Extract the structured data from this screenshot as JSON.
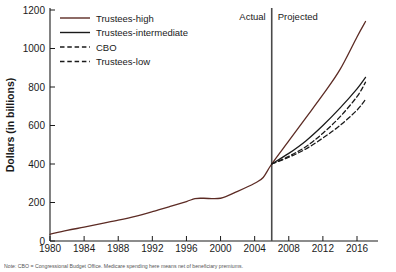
{
  "chart_data": {
    "type": "line",
    "title": "",
    "xlabel": "",
    "ylabel": "Dollars (in billions)",
    "xlim": [
      1980,
      2017
    ],
    "ylim": [
      0,
      1200
    ],
    "xticks": [
      1980,
      1984,
      1988,
      1992,
      1996,
      2000,
      2004,
      2008,
      2012,
      2016
    ],
    "yticks": [
      0,
      200,
      400,
      600,
      800,
      1000,
      1200
    ],
    "grid": false,
    "legend_position": "top-left",
    "annotations": [
      {
        "name": "actual-label",
        "text": "Actual",
        "x": 2003.2,
        "y": 1150
      },
      {
        "name": "projected-label",
        "text": "Projected",
        "x": 2007.0,
        "y": 1150
      },
      {
        "name": "divider",
        "text": "",
        "x": 2006,
        "y": 0
      }
    ],
    "divider_year": 2006,
    "series": [
      {
        "name": "Trustees-high",
        "color": "#5c2b24",
        "dash": "none",
        "x": [
          1980,
          1982,
          1984,
          1986,
          1988,
          1990,
          1992,
          1994,
          1996,
          1997,
          1998,
          2000,
          2002,
          2004,
          2005,
          2006,
          2008,
          2010,
          2012,
          2014,
          2016,
          2017
        ],
        "values": [
          35,
          55,
          72,
          90,
          108,
          128,
          152,
          178,
          205,
          220,
          222,
          222,
          258,
          300,
          330,
          400,
          520,
          640,
          760,
          890,
          1060,
          1140
        ]
      },
      {
        "name": "Trustees-intermediate",
        "color": "#1a1a1a",
        "dash": "none",
        "x": [
          2006,
          2008,
          2010,
          2012,
          2014,
          2016,
          2017
        ],
        "values": [
          400,
          455,
          520,
          600,
          690,
          790,
          850
        ]
      },
      {
        "name": "CBO",
        "color": "#1a1a1a",
        "dash": "dashed",
        "x": [
          2006,
          2008,
          2010,
          2012,
          2014,
          2016,
          2017
        ],
        "values": [
          400,
          440,
          490,
          560,
          645,
          750,
          825
        ]
      },
      {
        "name": "Trustees-low",
        "color": "#1a1a1a",
        "dash": "dashed",
        "x": [
          2006,
          2008,
          2010,
          2012,
          2014,
          2016,
          2017
        ],
        "values": [
          400,
          435,
          478,
          535,
          600,
          680,
          735
        ]
      }
    ],
    "historical_note": "Single historical line 1980-2006 shared by all series, drawn in Trustees-high color"
  },
  "legend": {
    "items": [
      {
        "label": "Trustees-high",
        "color": "#5c2b24",
        "dash": "none"
      },
      {
        "label": "Trustees-intermediate",
        "color": "#1a1a1a",
        "dash": "none"
      },
      {
        "label": "CBO",
        "color": "#1a1a1a",
        "dash": "dashed"
      },
      {
        "label": "Trustees-low",
        "color": "#1a1a1a",
        "dash": "dashed"
      }
    ]
  },
  "axis": {
    "ylabel": "Dollars (in billions)",
    "ytick_labels": [
      "1200",
      "1000",
      "800",
      "600",
      "400",
      "200",
      "0"
    ],
    "xtick_labels": [
      "1980",
      "1984",
      "1988",
      "1992",
      "1996",
      "2000",
      "2004",
      "2008",
      "2012",
      "2016"
    ]
  },
  "regions": {
    "actual": "Actual",
    "projected": "Projected"
  },
  "caption": {
    "text": "Note: CBO = Congressional Budget Office. Medicare spending here means net of beneficiary premiums."
  }
}
